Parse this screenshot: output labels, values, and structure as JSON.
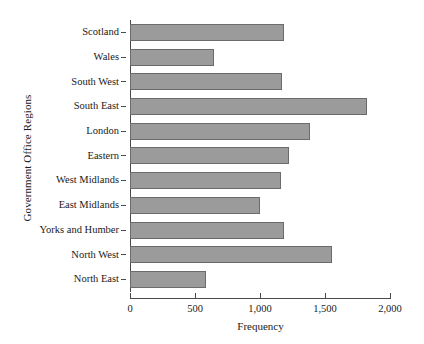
{
  "chart_data": {
    "type": "bar",
    "orientation": "horizontal",
    "title": "",
    "xlabel": "Frequency",
    "ylabel": "Government Office Regions",
    "categories": [
      "Scotland",
      "Wales",
      "South West",
      "South East",
      "London",
      "Eastern",
      "West Midlands",
      "East Midlands",
      "Yorks and Humber",
      "North West",
      "North East"
    ],
    "values": [
      1185,
      645,
      1170,
      1825,
      1385,
      1225,
      1160,
      1000,
      1185,
      1555,
      585
    ],
    "xlim": [
      0,
      2000
    ],
    "xticks": [
      0,
      500,
      1000,
      1500,
      2000
    ],
    "xtick_labels": [
      "0",
      "500",
      "1,000",
      "1,500",
      "2,000"
    ],
    "grid": false,
    "legend": false,
    "bar_fill_color": "#9b9b9b",
    "bar_edge_color": "#6b6b6b",
    "axis_color": "#4a4a4a",
    "background_color": "#ffffff"
  }
}
